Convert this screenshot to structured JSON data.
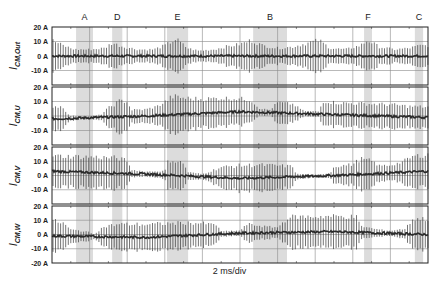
{
  "chart_data": {
    "type": "line",
    "title": "",
    "xlabel": "2 ms/div",
    "x_divisions": 10,
    "grid": true,
    "segment_markers": [
      {
        "label": "A",
        "x_start_div": 0.64,
        "x_end_div": 1.09
      },
      {
        "label": "D",
        "x_start_div": 1.6,
        "x_end_div": 1.87
      },
      {
        "label": "E",
        "x_start_div": 3.06,
        "x_end_div": 3.62
      },
      {
        "label": "B",
        "x_start_div": 5.35,
        "x_end_div": 6.25
      },
      {
        "label": "F",
        "x_start_div": 8.3,
        "x_end_div": 8.51
      },
      {
        "label": "C",
        "x_start_div": 9.65,
        "x_end_div": 9.87
      }
    ],
    "panels": [
      {
        "name": "I_CM,Out",
        "ylabel_main": "I",
        "ylabel_sub": "CM,Out",
        "yticks": [
          "20 A",
          "10 A",
          "0 A",
          "-10 A"
        ],
        "ylim": [
          -20,
          20
        ],
        "envelope_div": [
          [
            0,
            12
          ],
          [
            0.3,
            8
          ],
          [
            0.6,
            5
          ],
          [
            1.0,
            5
          ],
          [
            1.4,
            6
          ],
          [
            1.6,
            10
          ],
          [
            1.9,
            7
          ],
          [
            2.3,
            5
          ],
          [
            2.7,
            5
          ],
          [
            3.0,
            8
          ],
          [
            3.3,
            13
          ],
          [
            3.6,
            6
          ],
          [
            3.9,
            4
          ],
          [
            4.3,
            5
          ],
          [
            4.6,
            7
          ],
          [
            5.0,
            9
          ],
          [
            5.3,
            12
          ],
          [
            5.6,
            8
          ],
          [
            6.0,
            6
          ],
          [
            6.4,
            7
          ],
          [
            6.8,
            10
          ],
          [
            7.1,
            12
          ],
          [
            7.4,
            6
          ],
          [
            7.8,
            5
          ],
          [
            8.2,
            8
          ],
          [
            8.4,
            12
          ],
          [
            8.7,
            7
          ],
          [
            9.1,
            5
          ],
          [
            9.5,
            6
          ],
          [
            9.8,
            8
          ],
          [
            10,
            8
          ]
        ],
        "offset_div": [
          [
            0,
            0
          ],
          [
            10,
            0
          ]
        ]
      },
      {
        "name": "I_CM,U",
        "ylabel_main": "I",
        "ylabel_sub": "CM,U",
        "yticks": [
          "20 A",
          "10 A",
          "0 A",
          "-10 A"
        ],
        "ylim": [
          -20,
          20
        ],
        "envelope_div": [
          [
            0,
            10
          ],
          [
            0.3,
            9
          ],
          [
            0.45,
            2
          ],
          [
            1.0,
            1
          ],
          [
            1.3,
            2
          ],
          [
            1.5,
            7
          ],
          [
            1.8,
            12
          ],
          [
            2.0,
            12
          ],
          [
            2.1,
            5
          ],
          [
            2.5,
            5
          ],
          [
            2.8,
            7
          ],
          [
            3.0,
            10
          ],
          [
            3.2,
            14
          ],
          [
            3.6,
            12
          ],
          [
            4.0,
            11
          ],
          [
            4.5,
            11
          ],
          [
            5.0,
            10
          ],
          [
            5.3,
            9
          ],
          [
            5.5,
            3
          ],
          [
            5.8,
            2
          ],
          [
            6.0,
            8
          ],
          [
            6.4,
            7
          ],
          [
            6.7,
            2
          ],
          [
            7.1,
            2
          ],
          [
            7.2,
            10
          ],
          [
            7.6,
            9
          ],
          [
            8.0,
            9
          ],
          [
            8.5,
            9
          ],
          [
            9.0,
            9
          ],
          [
            9.5,
            8
          ],
          [
            10,
            8
          ]
        ],
        "offset_div": [
          [
            0,
            -2
          ],
          [
            2.5,
            0
          ],
          [
            5,
            3
          ],
          [
            7.5,
            1
          ],
          [
            10,
            -1
          ]
        ]
      },
      {
        "name": "I_CM,V",
        "ylabel_main": "I",
        "ylabel_sub": "CM,V",
        "yticks": [
          "20 A",
          "10 A",
          "0 A",
          "-10 A"
        ],
        "ylim": [
          -20,
          20
        ],
        "envelope_div": [
          [
            0,
            12
          ],
          [
            1.0,
            12
          ],
          [
            1.7,
            12
          ],
          [
            2.0,
            10
          ],
          [
            2.1,
            3
          ],
          [
            2.5,
            2
          ],
          [
            3.0,
            3
          ],
          [
            3.1,
            12
          ],
          [
            3.5,
            10
          ],
          [
            3.6,
            3
          ],
          [
            4.0,
            2
          ],
          [
            4.5,
            8
          ],
          [
            5.0,
            10
          ],
          [
            5.5,
            10
          ],
          [
            6.0,
            9
          ],
          [
            6.4,
            8
          ],
          [
            6.5,
            2
          ],
          [
            7.0,
            1
          ],
          [
            7.4,
            2
          ],
          [
            7.5,
            7
          ],
          [
            8.0,
            8
          ],
          [
            8.2,
            12
          ],
          [
            8.5,
            10
          ],
          [
            8.7,
            6
          ],
          [
            9.0,
            6
          ],
          [
            9.3,
            8
          ],
          [
            9.6,
            12
          ],
          [
            10,
            13
          ]
        ],
        "offset_div": [
          [
            0,
            3
          ],
          [
            2.5,
            1
          ],
          [
            5,
            -2
          ],
          [
            7.5,
            0
          ],
          [
            10,
            3
          ]
        ]
      },
      {
        "name": "I_CM,W",
        "ylabel_main": "I",
        "ylabel_sub": "CM,W",
        "yticks": [
          "20 A",
          "10 A",
          "0 A",
          "-10 A",
          "-20 A"
        ],
        "ylim": [
          -20,
          20
        ],
        "envelope_div": [
          [
            0,
            12
          ],
          [
            0.3,
            10
          ],
          [
            0.5,
            5
          ],
          [
            0.9,
            4
          ],
          [
            1.1,
            2
          ],
          [
            1.4,
            8
          ],
          [
            1.8,
            10
          ],
          [
            2.5,
            10
          ],
          [
            3.0,
            10
          ],
          [
            3.5,
            10
          ],
          [
            4.0,
            9
          ],
          [
            4.4,
            7
          ],
          [
            4.5,
            2
          ],
          [
            5.0,
            2
          ],
          [
            5.2,
            7
          ],
          [
            5.6,
            5
          ],
          [
            6.0,
            4
          ],
          [
            6.3,
            12
          ],
          [
            6.8,
            12
          ],
          [
            7.5,
            12
          ],
          [
            8.1,
            12
          ],
          [
            8.2,
            5
          ],
          [
            8.6,
            3
          ],
          [
            9.0,
            2
          ],
          [
            9.4,
            4
          ],
          [
            9.6,
            12
          ],
          [
            10,
            12
          ]
        ],
        "offset_div": [
          [
            0,
            -1
          ],
          [
            2.5,
            -2
          ],
          [
            5,
            1
          ],
          [
            7.5,
            2
          ],
          [
            10,
            0
          ]
        ]
      }
    ]
  },
  "figure": {
    "xlabel": "2 ms/div"
  }
}
